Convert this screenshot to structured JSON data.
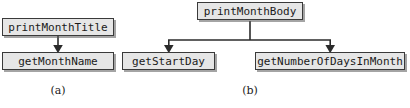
{
  "figure": {
    "type": "call-hierarchy-diagram",
    "background_color": "#ffffff",
    "node_fill_color": "#e6e6e6",
    "node_border_color": "#3a3a3a",
    "edge_color": "#2b2b2b",
    "text_color": "#1a1a1a"
  },
  "panels": [
    {
      "id": "a",
      "caption": "(a)",
      "nodes": [
        {
          "id": "print-month-title",
          "label": "printMonthTitle"
        },
        {
          "id": "get-month-name",
          "label": "getMonthName"
        }
      ],
      "edges": [
        {
          "from": "print-month-title",
          "to": "get-month-name",
          "arrow": "down"
        }
      ]
    },
    {
      "id": "b",
      "caption": "(b)",
      "nodes": [
        {
          "id": "print-month-body",
          "label": "printMonthBody"
        },
        {
          "id": "get-start-day",
          "label": "getStartDay"
        },
        {
          "id": "get-number-of-days-in-month",
          "label": "getNumberOfDaysInMonth"
        }
      ],
      "edges": [
        {
          "from": "print-month-body",
          "to": "get-start-day",
          "arrow": "down"
        },
        {
          "from": "print-month-body",
          "to": "get-number-of-days-in-month",
          "arrow": "down"
        }
      ]
    }
  ]
}
